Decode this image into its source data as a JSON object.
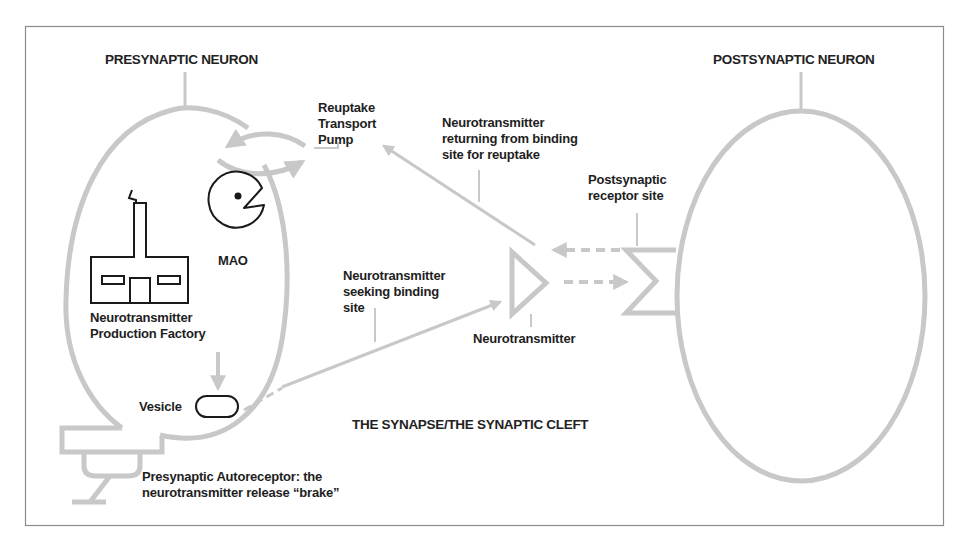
{
  "colors": {
    "outline": "#c8c8c8",
    "frame": "#8a8a8a",
    "ink": "#1e1e1e",
    "background": "#ffffff"
  },
  "headings": {
    "presynaptic": "PRESYNAPTIC NEURON",
    "postsynaptic": "POSTSYNAPTIC NEURON",
    "synapse": "THE SYNAPSE/THE SYNAPTIC CLEFT"
  },
  "labels": {
    "reuptake_pump": [
      "Reuptake",
      "Transport",
      "Pump"
    ],
    "returning": [
      "Neurotransmitter",
      "returning from binding",
      "site for reuptake"
    ],
    "postsynaptic_receptor": [
      "Postsynaptic",
      "receptor site"
    ],
    "mao": "MAO",
    "factory": [
      "Neurotransmitter",
      "Production Factory"
    ],
    "seeking": [
      "Neurotransmitter",
      "seeking binding",
      "site"
    ],
    "neurotransmitter": "Neurotransmitter",
    "vesicle": "Vesicle",
    "autoreceptor": [
      "Presynaptic Autoreceptor: the",
      "neurotransmitter release “brake”"
    ]
  },
  "icons": {
    "factory": "factory-icon",
    "mao": "pacman-enzyme-icon",
    "vesicle": "vesicle-capsule-icon",
    "neurotransmitter": "triangle-molecule-icon",
    "receptor": "notched-receptor-icon",
    "pump": "reuptake-pump-arrows-icon"
  }
}
